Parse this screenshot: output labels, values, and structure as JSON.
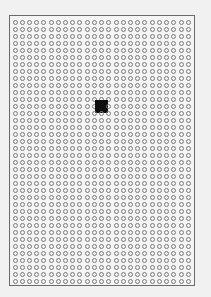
{
  "board": {
    "columns": 25,
    "rows": 38,
    "cell_shape": "hollow-circle",
    "cell_color": "#7a7a7a",
    "border_color": "#6a6a6a",
    "background_color": "#f4f4f4"
  },
  "marker": {
    "column": 12,
    "row": 12,
    "shape": "filled-square",
    "color": "#0e0e0e"
  }
}
